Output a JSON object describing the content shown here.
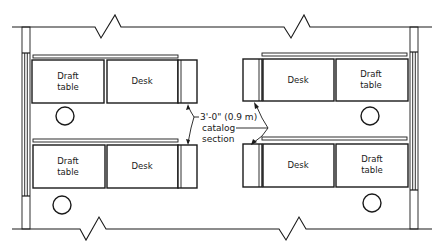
{
  "diagram": {
    "type": "floor-plan",
    "labels": {
      "draft_table_line1": "Draft",
      "draft_table_line2": "table",
      "desk": "Desk",
      "dimension_line1": "3'-0\" (0.9 m)",
      "dimension_line2": "catalog",
      "dimension_line3": "section"
    },
    "workstations": [
      {
        "position": "top-left",
        "items": [
          "Draft table",
          "Desk",
          "catalog section"
        ]
      },
      {
        "position": "top-right",
        "items": [
          "catalog section",
          "Desk",
          "Draft table"
        ]
      },
      {
        "position": "bottom-left",
        "items": [
          "Draft table",
          "Desk",
          "catalog section"
        ]
      },
      {
        "position": "bottom-right",
        "items": [
          "catalog section",
          "Desk",
          "Draft table"
        ]
      }
    ],
    "chairs": 4,
    "colors": {
      "line": "#1a1a1a",
      "background": "#ffffff"
    }
  }
}
